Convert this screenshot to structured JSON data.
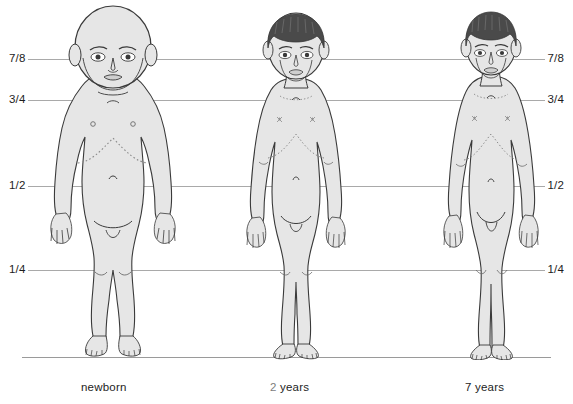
{
  "diagram": {
    "background_color": "#ffffff",
    "line_color": "#a9a9a9",
    "body_fill": "#e8e8e8",
    "body_stroke": "#3b3b3b",
    "hair_color": "#4a4a4a",
    "accent_color": "#7d7d7d",
    "text_color": "#1d1d1d"
  },
  "proportion_lines": [
    {
      "label": "7/8",
      "label_right": "7/8",
      "y": 59
    },
    {
      "label": "3/4",
      "label_right": "3/4",
      "y": 100
    },
    {
      "label": "1/2",
      "label_right": "1/2",
      "y": 186
    },
    {
      "label": "1/4",
      "label_right": "1/4",
      "y": 270
    }
  ],
  "baseline": {
    "y": 357
  },
  "figures": [
    {
      "id": "newborn",
      "caption_prefix": "",
      "caption_text": "newborn",
      "center_x": 112,
      "head_top": 12,
      "hair": false,
      "scale": 1.0
    },
    {
      "id": "two-years",
      "caption_prefix": "2",
      "caption_text": " years",
      "center_x": 295,
      "head_top": 14,
      "hair": true,
      "scale": 0.92
    },
    {
      "id": "seven-years",
      "caption_prefix": "",
      "caption_text": "7 years",
      "center_x": 490,
      "head_top": 14,
      "hair": true,
      "scale": 0.88
    }
  ],
  "captions": [
    {
      "id": "newborn",
      "accent": "",
      "text": "newborn",
      "x": 81
    },
    {
      "id": "two-years",
      "accent": "2",
      "text": " years",
      "x": 270
    },
    {
      "id": "seven-years",
      "accent": "",
      "text": "7 years",
      "x": 465
    }
  ]
}
